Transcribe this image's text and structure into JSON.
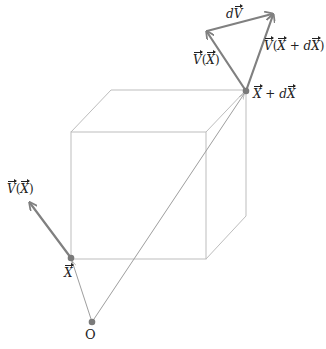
{
  "colors": {
    "cube_edge": "#bdbdbd",
    "thin_line": "#9e9e9e",
    "vector": "#808080",
    "point": "#7a7a7a",
    "label": "#222222"
  },
  "points": {
    "O": {
      "x": 92,
      "y": 322,
      "label": "O"
    },
    "X": {
      "x": 71,
      "y": 258,
      "label": "X"
    },
    "X_plus_dX": {
      "x": 246,
      "y": 91,
      "label_main": "X",
      "label_op": " + ",
      "label_d": "d",
      "label_tail": "X"
    }
  },
  "cube": {
    "front": [
      [
        71,
        132
      ],
      [
        206,
        132
      ],
      [
        206,
        259
      ],
      [
        71,
        259
      ]
    ],
    "back_offset": [
      40,
      -42
    ]
  },
  "vectors": {
    "V_at_X": {
      "from": [
        71,
        258
      ],
      "to": [
        29,
        202
      ],
      "label_v": "V",
      "label_arg": "X"
    },
    "V_at_X_top": {
      "from": [
        246,
        91
      ],
      "to": [
        206,
        31
      ],
      "label_v": "V",
      "label_arg": "X"
    },
    "V_at_X_plus_dX": {
      "from": [
        246,
        91
      ],
      "to": [
        274,
        13
      ],
      "label_v": "V",
      "label_arg_a": "X",
      "label_arg_op": " + ",
      "label_arg_d": "d",
      "label_arg_b": "X"
    },
    "dV": {
      "from": [
        206,
        31
      ],
      "to": [
        274,
        13
      ],
      "label_d": "d",
      "label_v": "V"
    }
  },
  "labels": {
    "open_paren": "(",
    "close_paren": ")"
  }
}
